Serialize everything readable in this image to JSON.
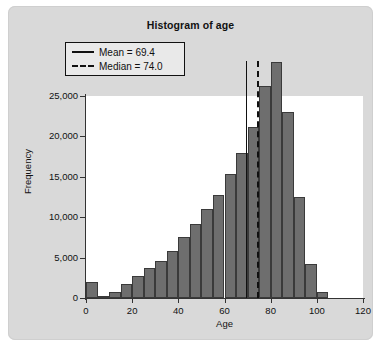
{
  "chart_data": {
    "type": "bar",
    "title": "Histogram of age",
    "xlabel": "Age",
    "ylabel": "Frequency",
    "xlim": [
      0,
      120
    ],
    "ylim": [
      0,
      25000
    ],
    "xticks": [
      "0",
      "20",
      "40",
      "60",
      "80",
      "100",
      "120"
    ],
    "xtick_values": [
      0,
      20,
      40,
      60,
      80,
      100,
      120
    ],
    "yticks": [
      "0",
      "5,000",
      "10,000",
      "15,000",
      "20,000",
      "25,000"
    ],
    "ytick_values": [
      0,
      5000,
      10000,
      15000,
      20000,
      25000
    ],
    "grid": false,
    "bin_width": 5,
    "bin_starts": [
      0,
      5,
      10,
      15,
      20,
      25,
      30,
      35,
      40,
      45,
      50,
      55,
      60,
      65,
      70,
      75,
      80,
      85,
      90,
      95,
      100
    ],
    "values": [
      2000,
      300,
      700,
      1700,
      2700,
      3700,
      4600,
      5800,
      7500,
      9200,
      11000,
      12800,
      15400,
      18000,
      21200,
      26200,
      29200,
      23000,
      12500,
      4200,
      700
    ],
    "bars": [
      {
        "bin": "0–5",
        "value": 2000
      },
      {
        "bin": "5–10",
        "value": 300
      },
      {
        "bin": "10–15",
        "value": 700
      },
      {
        "bin": "15–20",
        "value": 1700
      },
      {
        "bin": "20–25",
        "value": 2700
      },
      {
        "bin": "25–30",
        "value": 3700
      },
      {
        "bin": "30–35",
        "value": 4600
      },
      {
        "bin": "35–40",
        "value": 5800
      },
      {
        "bin": "40–45",
        "value": 7500
      },
      {
        "bin": "45–50",
        "value": 9200
      },
      {
        "bin": "50–55",
        "value": 11000
      },
      {
        "bin": "55–60",
        "value": 12800
      },
      {
        "bin": "60–65",
        "value": 15400
      },
      {
        "bin": "65–70",
        "value": 18000
      },
      {
        "bin": "70–75",
        "value": 21200
      },
      {
        "bin": "75–80",
        "value": 26200
      },
      {
        "bin": "80–85",
        "value": 29200
      },
      {
        "bin": "85–90",
        "value": 23000
      },
      {
        "bin": "90–95",
        "value": 12500
      },
      {
        "bin": "95–100",
        "value": 4200
      },
      {
        "bin": "100–105",
        "value": 700
      }
    ],
    "annotations": [
      {
        "name": "mean",
        "label": "Mean = 69.4",
        "value": 69.4,
        "style": "solid"
      },
      {
        "name": "median",
        "label": "Median = 74.0",
        "value": 74.0,
        "style": "dashed"
      }
    ],
    "legend": {
      "position": "top-left",
      "entries": [
        {
          "label": "Mean = 69.4",
          "style": "solid"
        },
        {
          "label": "Median = 74.0",
          "style": "dashed"
        }
      ]
    },
    "colors": {
      "bar_fill": "#6e6e6e",
      "bar_edge": "#3a3a3a",
      "figure_background": "#d9d9d9",
      "plot_background": "#ffffff",
      "axis": "#333333",
      "text": "#111111"
    }
  }
}
